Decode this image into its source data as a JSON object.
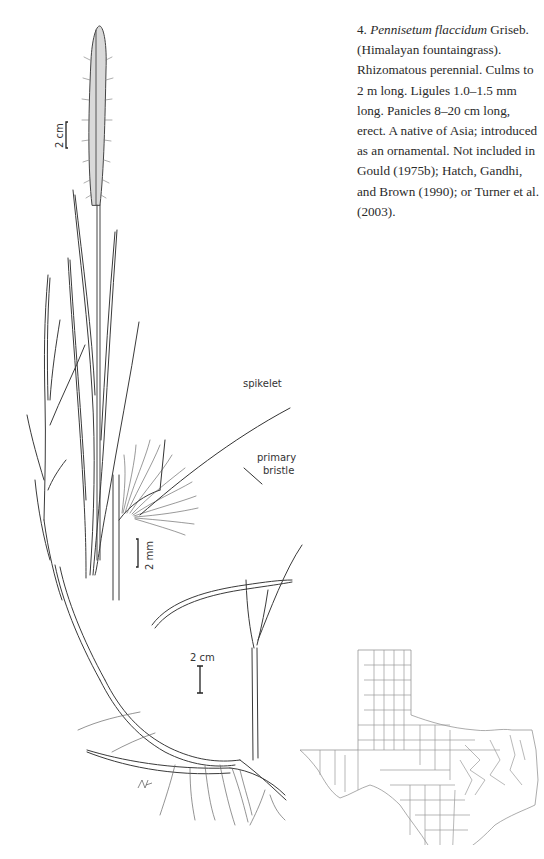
{
  "description": {
    "number": "4.",
    "scientific_name": "Pennisetum flaccidum",
    "authority": "Griseb.",
    "text": "(Himalayan fountaingrass). Rhizomatous perennial. Culms to 2 m long. Ligules 1.0–1.5 mm long. Panicles 8–20 cm long, erect. A native of Asia; introduced as an ornamental. Not included in Gould (1975b); Hatch, Gandhi, and Brown (1990); or Turner et al. (2003)."
  },
  "illustration": {
    "labels": {
      "spikelet": "spikelet",
      "primary_bristle": "primary bristle",
      "primary": "primary",
      "bristle": "bristle"
    },
    "scale_bars": {
      "panicle": "2 cm",
      "spikelet_detail": "2 mm",
      "base": "2 cm"
    },
    "artist_signature": "glyph-signature"
  },
  "map": {
    "region": "Texas counties distribution map"
  },
  "colors": {
    "ink": "#2a2a2a",
    "map_lines": "#9a9a9a",
    "background": "#ffffff"
  }
}
